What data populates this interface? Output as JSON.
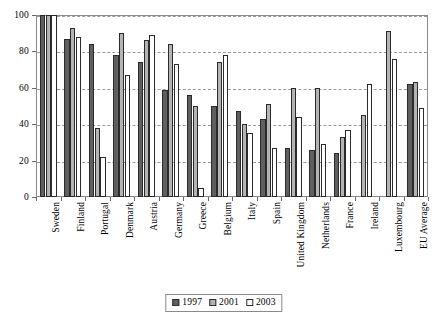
{
  "chart_data": {
    "type": "bar",
    "title": "",
    "subtitle": "",
    "xlabel": "",
    "ylabel": "",
    "ylim": [
      0,
      100
    ],
    "yticks": [
      0,
      20,
      40,
      60,
      80,
      100
    ],
    "grid": true,
    "legend_position": "bottom",
    "categories": [
      "Sweden",
      "Finland",
      "Portugal",
      "Denmark",
      "Austria",
      "Germany",
      "Greece",
      "Belgium",
      "Italy",
      "Spain",
      "United Kingdom",
      "Netherlands",
      "France",
      "Ireland",
      "Luxembourg",
      "EU Average"
    ],
    "series": [
      {
        "name": "1997",
        "color": "#5f5f5f",
        "values": [
          100,
          87,
          84,
          78,
          74,
          59,
          56,
          50,
          47,
          43,
          27,
          26,
          24,
          null,
          null,
          62
        ]
      },
      {
        "name": "2001",
        "color": "#b4b4b4",
        "values": [
          100,
          93,
          38,
          90,
          86,
          84,
          50,
          74,
          40,
          51,
          60,
          60,
          33,
          45,
          91,
          63
        ]
      },
      {
        "name": "2003",
        "color": "#ffffff",
        "values": [
          100,
          88,
          22,
          67,
          89,
          73,
          5,
          78,
          35,
          27,
          44,
          29,
          37,
          62,
          76,
          49
        ]
      }
    ]
  },
  "legend": {
    "entries": [
      {
        "label": "1997"
      },
      {
        "label": "2001"
      },
      {
        "label": "2003"
      }
    ]
  }
}
